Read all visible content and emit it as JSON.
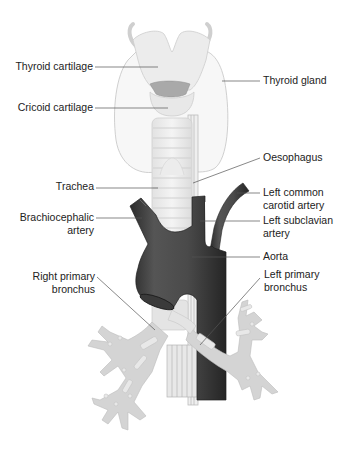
{
  "figure": {
    "colors": {
      "background": "#ffffff",
      "label_text": "#222222",
      "leader_line": "#555555",
      "aorta": "#4a4a4a",
      "aorta_dark": "#2b2b2b",
      "cartilage": "#e6e6e6",
      "cartilage_outline": "#c9c9c9",
      "bronchi": "#cfcfcf",
      "thyroid_outline": "#bdbdbd"
    }
  },
  "labels": {
    "thyroid_cartilage": {
      "lines": [
        "Thyroid cartilage"
      ],
      "side": "left"
    },
    "thyroid_gland": {
      "lines": [
        "Thyroid gland"
      ],
      "side": "right"
    },
    "cricoid_cartilage": {
      "lines": [
        "Cricoid cartilage"
      ],
      "side": "left"
    },
    "oesophagus": {
      "lines": [
        "Oesophagus"
      ],
      "side": "right"
    },
    "trachea": {
      "lines": [
        "Trachea"
      ],
      "side": "left"
    },
    "left_common_carotid": {
      "lines": [
        "Left common",
        "carotid artery"
      ],
      "side": "right"
    },
    "brachiocephalic": {
      "lines": [
        "Brachiocephalic",
        "artery"
      ],
      "side": "left"
    },
    "left_subclavian": {
      "lines": [
        "Left subclavian",
        "artery"
      ],
      "side": "right"
    },
    "aorta": {
      "lines": [
        "Aorta"
      ],
      "side": "right"
    },
    "right_primary_bronchus": {
      "lines": [
        "Right primary",
        "bronchus"
      ],
      "side": "left"
    },
    "left_primary_bronchus": {
      "lines": [
        "Left primary",
        "bronchus"
      ],
      "side": "right"
    }
  }
}
